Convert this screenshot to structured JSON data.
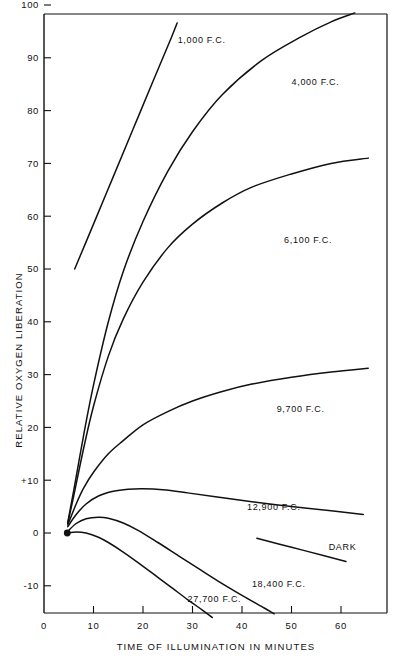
{
  "chart_data": {
    "type": "line",
    "title": "",
    "xlabel": "TIME OF ILLUMINATION IN MINUTES",
    "ylabel": "RELATIVE OXYGEN LIBERATION",
    "xlim": [
      0,
      70
    ],
    "ylim": [
      -15,
      100
    ],
    "xticks": [
      0,
      10,
      20,
      30,
      40,
      50,
      60
    ],
    "xtick_labels": [
      "0",
      "10",
      "20",
      "30",
      "40",
      "50",
      "60"
    ],
    "yticks": [
      -10,
      0,
      10,
      20,
      30,
      40,
      50,
      60,
      70,
      80,
      90,
      100
    ],
    "ytick_labels": [
      "-10",
      "0",
      "+10",
      "20",
      "30",
      "40",
      "50",
      "60",
      "70",
      "80",
      "90",
      "100"
    ],
    "grid": false,
    "legend_position": "inline-curve-labels",
    "origin_marker": {
      "x": 4.7,
      "y": 0,
      "style": "filled-circle"
    },
    "series": [
      {
        "name": "1,000 F.C.",
        "label_x": 27.0,
        "label_y": 93.5,
        "points": [
          [
            6.2,
            50.0
          ],
          [
            10.0,
            58.5
          ],
          [
            14.0,
            67.5
          ],
          [
            18.0,
            76.5
          ],
          [
            22.0,
            85.5
          ],
          [
            25.8,
            94.0
          ],
          [
            26.9,
            96.6
          ]
        ]
      },
      {
        "name": "4,000 F.C.",
        "label_x": 50.0,
        "label_y": 85.5,
        "points": [
          [
            4.8,
            2.0
          ],
          [
            6.0,
            8.0
          ],
          [
            8.0,
            18.5
          ],
          [
            10.0,
            28.0
          ],
          [
            13.0,
            40.0
          ],
          [
            16.0,
            49.5
          ],
          [
            20.0,
            59.0
          ],
          [
            25.0,
            68.5
          ],
          [
            30.0,
            76.0
          ],
          [
            36.0,
            83.0
          ],
          [
            44.0,
            89.5
          ],
          [
            52.0,
            94.0
          ],
          [
            58.0,
            96.8
          ],
          [
            62.8,
            98.5
          ]
        ]
      },
      {
        "name": "6,100 F.C.",
        "label_x": 48.5,
        "label_y": 55.5,
        "points": [
          [
            4.8,
            1.8
          ],
          [
            6.0,
            7.0
          ],
          [
            8.0,
            16.0
          ],
          [
            10.0,
            24.0
          ],
          [
            13.0,
            33.5
          ],
          [
            16.0,
            40.5
          ],
          [
            20.0,
            47.5
          ],
          [
            25.0,
            54.0
          ],
          [
            30.0,
            58.5
          ],
          [
            36.0,
            62.5
          ],
          [
            42.0,
            65.5
          ],
          [
            50.0,
            68.0
          ],
          [
            58.0,
            70.0
          ],
          [
            65.5,
            71.0
          ]
        ]
      },
      {
        "name": "9,700 F.C.",
        "label_x": 47.0,
        "label_y": 23.5,
        "points": [
          [
            4.8,
            1.5
          ],
          [
            6.5,
            5.5
          ],
          [
            8.0,
            8.5
          ],
          [
            10.0,
            11.5
          ],
          [
            13.0,
            15.0
          ],
          [
            16.0,
            17.5
          ],
          [
            20.0,
            20.5
          ],
          [
            25.0,
            23.0
          ],
          [
            30.0,
            25.0
          ],
          [
            36.0,
            26.8
          ],
          [
            42.0,
            28.2
          ],
          [
            50.0,
            29.5
          ],
          [
            58.0,
            30.5
          ],
          [
            65.5,
            31.2
          ]
        ]
      },
      {
        "name": "12,900 F.C.",
        "label_x": 41.0,
        "label_y": 5.0,
        "points": [
          [
            4.8,
            1.2
          ],
          [
            6.5,
            3.5
          ],
          [
            8.5,
            5.5
          ],
          [
            11.0,
            7.0
          ],
          [
            14.0,
            7.9
          ],
          [
            17.0,
            8.3
          ],
          [
            20.0,
            8.4
          ],
          [
            24.0,
            8.2
          ],
          [
            29.0,
            7.6
          ],
          [
            35.0,
            6.8
          ],
          [
            42.0,
            5.9
          ],
          [
            50.0,
            5.0
          ],
          [
            58.0,
            4.2
          ],
          [
            64.5,
            3.5
          ]
        ]
      },
      {
        "name": "18,400 F.C.",
        "label_x": 42.0,
        "label_y": -9.5,
        "points": [
          [
            4.8,
            0.3
          ],
          [
            6.5,
            1.8
          ],
          [
            8.5,
            2.7
          ],
          [
            11.0,
            3.0
          ],
          [
            13.0,
            2.8
          ],
          [
            16.0,
            1.9
          ],
          [
            19.0,
            0.5
          ],
          [
            23.0,
            -1.8
          ],
          [
            27.0,
            -4.2
          ],
          [
            31.0,
            -6.6
          ],
          [
            35.0,
            -9.0
          ],
          [
            40.0,
            -11.8
          ],
          [
            44.5,
            -14.2
          ],
          [
            46.5,
            -15.3
          ]
        ]
      },
      {
        "name": "27,700 F.C.",
        "label_x": 29.0,
        "label_y": -12.5,
        "points": [
          [
            4.8,
            0.0
          ],
          [
            6.5,
            0.2
          ],
          [
            8.5,
            0.0
          ],
          [
            11.0,
            -0.8
          ],
          [
            13.0,
            -1.8
          ],
          [
            16.0,
            -3.6
          ],
          [
            19.0,
            -5.6
          ],
          [
            23.0,
            -8.4
          ],
          [
            26.0,
            -10.5
          ],
          [
            29.0,
            -12.6
          ],
          [
            32.0,
            -14.6
          ],
          [
            34.0,
            -16.0
          ]
        ]
      },
      {
        "name": "DARK",
        "label_x": 57.5,
        "label_y": -2.5,
        "points": [
          [
            43.0,
            -1.0
          ],
          [
            50.0,
            -2.7
          ],
          [
            57.0,
            -4.4
          ],
          [
            61.0,
            -5.4
          ]
        ]
      }
    ]
  }
}
